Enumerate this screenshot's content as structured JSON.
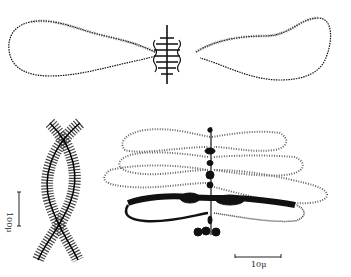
{
  "figure": {
    "panels": [
      {
        "id": "top",
        "description": "chromosome pair with two extended lateral loops"
      },
      {
        "id": "bottom-left",
        "description": "two twisted chromatid strands with lateral fibers"
      },
      {
        "id": "bottom-right",
        "description": "axis with multiple paired lateral loops"
      }
    ],
    "scale_bars": {
      "left": {
        "label": "100μ"
      },
      "right": {
        "label": "10μ"
      }
    },
    "colors": {
      "ink": "#111111",
      "light_ink": "#777777",
      "background": "#ffffff"
    }
  }
}
